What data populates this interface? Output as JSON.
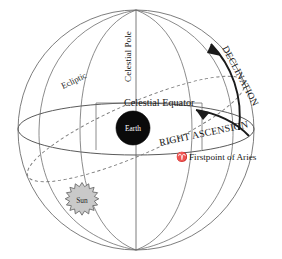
{
  "figure": {
    "background_color": "#ffffff"
  },
  "labels": {
    "celestial_pole": "Celestial Pole",
    "ecliptic": "Ecliptic",
    "celestial_equator": "Celestial Equator",
    "declination": "DECLINATION",
    "right_ascension": "RIGHT ASCENSION",
    "aries_symbol": "♈",
    "firstpoint_of_aries": "Firstpoint of Aries",
    "earth": "Earth",
    "sun": "Sun"
  },
  "colors": {
    "sphere_outline": "#6e6e6e",
    "meridian": "#6e6e6e",
    "equator": "#5a5a5a",
    "ecliptic": "#7a7a7a",
    "arrow_arc": "#1a1a1a",
    "earth_fill": "#0a0a0a",
    "earth_text": "#ffffff",
    "sun_fill": "#c9c9c9",
    "sun_stroke": "#5e5e5e",
    "sun_text": "#2a2a2a",
    "label_text": "#171717"
  },
  "icons": {
    "aries": "aries-symbol-icon",
    "earth": "earth-sphere-icon",
    "sun": "sun-starburst-icon",
    "declination_arrow": "declination-arrowhead-icon",
    "right_ascension_arrow": "right-ascension-arrowhead-icon"
  }
}
